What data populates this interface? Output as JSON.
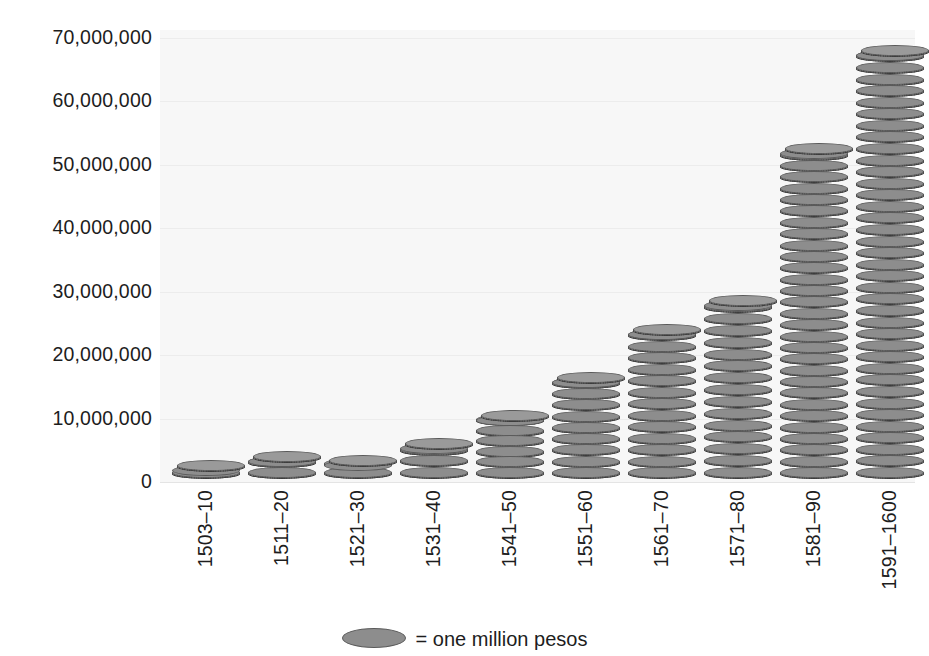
{
  "chart_data": {
    "type": "bar",
    "title": "",
    "subtitle": "",
    "xlabel": "",
    "ylabel": "",
    "categories": [
      "1503–10",
      "1511–20",
      "1521–30",
      "1531–40",
      "1541–50",
      "1551–60",
      "1561–70",
      "1571–80",
      "1581–90",
      "1591–1600"
    ],
    "values": [
      2000000,
      3500000,
      2800000,
      5500000,
      10000000,
      16000000,
      23500000,
      28000000,
      52000000,
      67500000
    ],
    "series": [
      {
        "name": "Treasure imports (pesos)",
        "values": [
          2000000,
          3500000,
          2800000,
          5500000,
          10000000,
          16000000,
          23500000,
          28000000,
          52000000,
          67500000
        ]
      }
    ],
    "ylim": [
      0,
      70000000
    ],
    "ytick_values": [
      0,
      10000000,
      20000000,
      30000000,
      40000000,
      50000000,
      60000000,
      70000000
    ],
    "ytick_labels": [
      "0",
      "10,000,000",
      "20,000,000",
      "30,000,000",
      "40,000,000",
      "50,000,000",
      "60,000,000",
      "70,000,000"
    ],
    "grid": true,
    "grid_axis": "y",
    "legend_position": "bottom-center",
    "legend": [
      {
        "label": "= one million pesos",
        "marker": "coin-ellipse"
      }
    ],
    "pictogram_unit": 1000000,
    "pictogram_unit_label": "one million pesos",
    "colors": {
      "coin_face": "#8d8d8d",
      "coin_edge_dark": "#4e4e4e",
      "coin_edge_light": "#a2a2a2",
      "coin_outline": "#5a5a5a",
      "plot_background": "#f7f7f7",
      "gridline": "#ececec",
      "text": "#1d1d1d",
      "page_background": "#ffffff"
    }
  },
  "legend": {
    "text": "= one million pesos"
  }
}
